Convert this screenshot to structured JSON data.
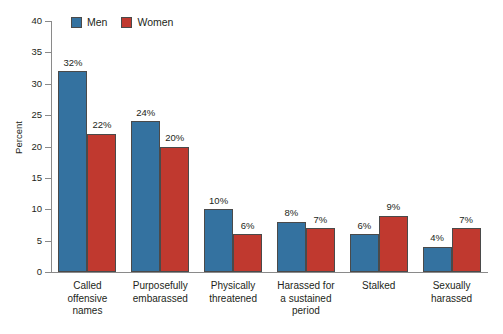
{
  "chart_data": {
    "type": "bar",
    "title": "",
    "subtitle": "",
    "xlabel": "",
    "ylabel": "Percent",
    "ylim": [
      0,
      40
    ],
    "ytick_step": 5,
    "yticks": [
      0,
      5,
      10,
      15,
      20,
      25,
      30,
      35,
      40
    ],
    "ytick_labels": [
      "0",
      "5",
      "10",
      "15",
      "20",
      "25",
      "30",
      "35",
      "40"
    ],
    "grid": false,
    "legend_position": "top-left-inside",
    "value_label_suffix": "%",
    "categories": [
      "Called offensive names",
      "Purposefully embarassed",
      "Physically threatened",
      "Harassed for a sustained period",
      "Stalked",
      "Sexually harassed"
    ],
    "category_lines": [
      [
        "Called",
        "offensive",
        "names"
      ],
      [
        "Purposefully",
        "embarassed"
      ],
      [
        "Physically",
        "threatened"
      ],
      [
        "Harassed for",
        "a sustained",
        "period"
      ],
      [
        "Stalked"
      ],
      [
        "Sexually",
        "harassed"
      ]
    ],
    "series": [
      {
        "name": "Men",
        "color": "#3472a0",
        "values": [
          32,
          24,
          10,
          8,
          6,
          4
        ],
        "value_labels": [
          "32%",
          "24%",
          "10%",
          "8%",
          "6%",
          "4%"
        ]
      },
      {
        "name": "Women",
        "color": "#c0392f",
        "values": [
          22,
          20,
          6,
          7,
          9,
          7
        ],
        "value_labels": [
          "22%",
          "20%",
          "6%",
          "7%",
          "9%",
          "7%"
        ]
      }
    ]
  },
  "legend": {
    "entries": [
      {
        "label": "Men",
        "color": "#3472a0"
      },
      {
        "label": "Women",
        "color": "#c0392f"
      }
    ]
  },
  "axis": {
    "y_title": "Percent"
  }
}
